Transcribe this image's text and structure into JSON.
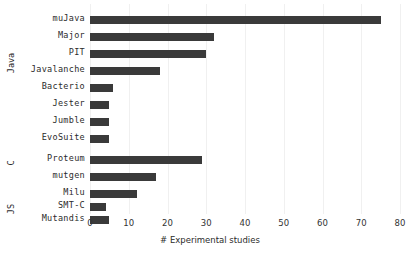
{
  "chart_data": {
    "type": "bar",
    "orientation": "horizontal",
    "title": "",
    "xlabel": "# Experimental studies",
    "ylabel": "",
    "xlim": [
      0,
      80
    ],
    "xticks": [
      0,
      10,
      20,
      30,
      40,
      50,
      60,
      70,
      80
    ],
    "grid": true,
    "grid_axis": "x",
    "legend": null,
    "bar_color": "#3a3a3a",
    "background_color": "#ffffff",
    "categories": [
      "muJava",
      "Major",
      "PIT",
      "Javalanche",
      "Bacterio",
      "Jester",
      "Jumble",
      "EvoSuite",
      "Proteum",
      "mutgen",
      "Milu",
      "SMT-C",
      "Mutandis"
    ],
    "values": [
      75,
      32,
      30,
      18,
      6,
      5,
      5,
      5,
      29,
      17,
      12,
      4,
      5
    ],
    "groups": [
      {
        "label": "Java",
        "categories": [
          "muJava",
          "Major",
          "PIT",
          "Javalanche",
          "Bacterio",
          "Jester",
          "Jumble",
          "EvoSuite"
        ],
        "values": [
          75,
          32,
          30,
          18,
          6,
          5,
          5,
          5
        ]
      },
      {
        "label": "C",
        "categories": [
          "Proteum",
          "mutgen",
          "Milu",
          "SMT-C"
        ],
        "values": [
          29,
          17,
          12,
          4
        ]
      },
      {
        "label": "JS",
        "categories": [
          "Mutandis"
        ],
        "values": [
          5
        ]
      }
    ],
    "series": [
      {
        "name": "# Experimental studies",
        "values": [
          75,
          32,
          30,
          18,
          6,
          5,
          5,
          5,
          29,
          17,
          12,
          4,
          5
        ]
      }
    ]
  },
  "axis": {
    "x_tick_labels": [
      "0",
      "10",
      "20",
      "30",
      "40",
      "50",
      "60",
      "70",
      "80"
    ],
    "x_axis_title": "# Experimental studies"
  },
  "group_labels": [
    "Java",
    "C",
    "JS"
  ],
  "bar_labels": [
    "muJava",
    "Major",
    "PIT",
    "Javalanche",
    "Bacterio",
    "Jester",
    "Jumble",
    "EvoSuite",
    "Proteum",
    "mutgen",
    "Milu",
    "SMT-C",
    "Mutandis"
  ]
}
